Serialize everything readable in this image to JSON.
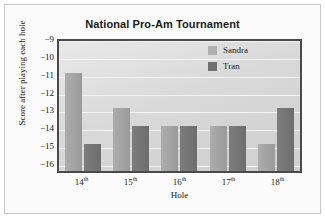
{
  "chart_data": {
    "type": "bar",
    "title": "National Pro-Am Tournament",
    "xlabel": "Hole",
    "ylabel": "Score after playing each hole",
    "categories": [
      "14th",
      "15th",
      "16th",
      "17th",
      "18th"
    ],
    "category_numbers": [
      "14",
      "15",
      "16",
      "17",
      "18"
    ],
    "category_suffix": "th",
    "series": [
      {
        "name": "Sandra",
        "values": [
          -11,
          -13,
          -14,
          -14,
          -15
        ],
        "color": "#a8a8a8"
      },
      {
        "name": "Tran",
        "values": [
          -15,
          -14,
          -14,
          -14,
          -13
        ],
        "color": "#757575"
      }
    ],
    "ylim": [
      -16.5,
      -9
    ],
    "yticks": [
      "-9",
      "-10",
      "-11",
      "-12",
      "-13",
      "-14",
      "-15",
      "-16"
    ],
    "ytick_values": [
      -9,
      -10,
      -11,
      -12,
      -13,
      -14,
      -15,
      -16
    ],
    "grid": true,
    "legend_position": "top-right"
  },
  "legend": {
    "entries": [
      {
        "label": "Sandra"
      },
      {
        "label": "Tran"
      }
    ]
  },
  "colors": {
    "sandra": "#a8a8a8",
    "tran": "#757575",
    "plot_border": "#4a4a4a",
    "gridline": "#f4f4f4",
    "text": "#1a1a1a"
  }
}
